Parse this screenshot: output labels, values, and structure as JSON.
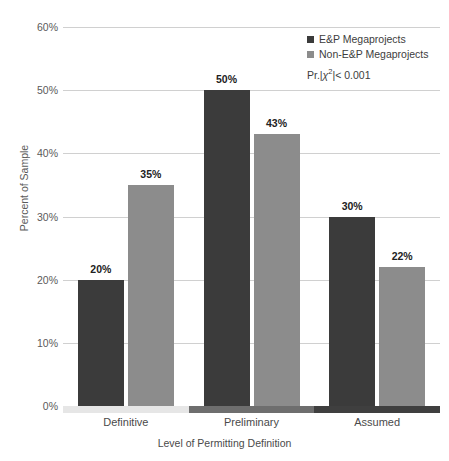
{
  "chart_data": {
    "type": "bar",
    "title": "",
    "subtitle": "",
    "xlabel": "Level of Permitting Definition",
    "ylabel": "Percent of Sample",
    "categories": [
      "Definitive",
      "Preliminary",
      "Assumed"
    ],
    "series": [
      {
        "name": "E&P Megaprojects",
        "color": "#3b3b3b",
        "values": [
          20,
          50,
          30
        ],
        "labels": [
          "20%",
          "50%",
          "30%"
        ]
      },
      {
        "name": "Non-E&P Megaprojects",
        "color": "#8c8c8c",
        "values": [
          35,
          43,
          22
        ],
        "labels": [
          "35%",
          "43%",
          "22%"
        ]
      }
    ],
    "ylim": [
      0,
      60
    ],
    "yticks": [
      0,
      10,
      20,
      30,
      40,
      50,
      60
    ],
    "ytick_labels": [
      "0%",
      "10%",
      "20%",
      "30%",
      "40%",
      "50%",
      "60%"
    ],
    "grid": true,
    "legend_position": "top-right",
    "annotations": [
      "Pr.|χ²|< 0.001"
    ]
  },
  "legend": {
    "items": [
      {
        "label": "E&P Megaprojects",
        "color": "#3b3b3b"
      },
      {
        "label": "Non-E&P Megaprojects",
        "color": "#8c8c8c"
      }
    ],
    "note_prefix": "Pr.|",
    "note_chi": "χ",
    "note_exp": "2",
    "note_suffix": "|< 0.001"
  },
  "axes": {
    "y_title": "Percent of Sample",
    "x_title": "Level of Permitting Definition",
    "y_ticks": [
      "60%",
      "50%",
      "40%",
      "30%",
      "20%",
      "10%",
      "0%"
    ]
  },
  "baseline_segments": [
    {
      "color": "#e6e6e6"
    },
    {
      "color": "#6e6e6e"
    },
    {
      "color": "#3f3f3f"
    }
  ]
}
